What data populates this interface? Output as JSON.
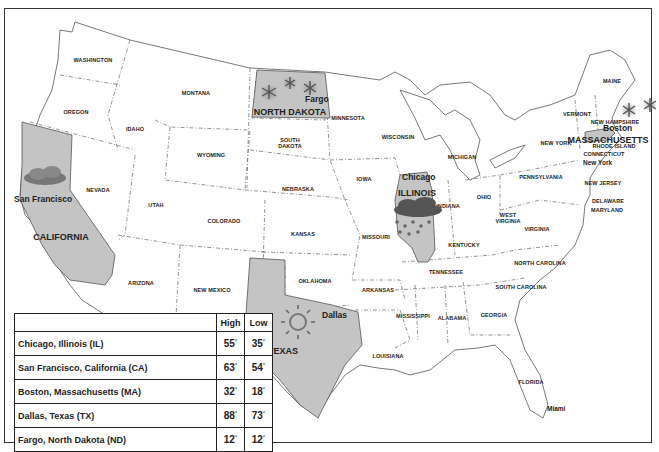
{
  "map": {
    "title": "US Weather Map",
    "highlight_color": "#c4c4c4",
    "state_labels": [
      {
        "name": "WASHINGTON",
        "x": 93,
        "y": 60
      },
      {
        "name": "OREGON",
        "x": 76,
        "y": 112
      },
      {
        "name": "IDAHO",
        "x": 135,
        "y": 129
      },
      {
        "name": "MONTANA",
        "x": 196,
        "y": 93
      },
      {
        "name": "WYOMING",
        "x": 211,
        "y": 155
      },
      {
        "name": "SOUTH\nDAKOTA",
        "x": 290,
        "y": 143
      },
      {
        "name": "MINNESOTA",
        "x": 348,
        "y": 118
      },
      {
        "name": "WISCONSIN",
        "x": 398,
        "y": 137
      },
      {
        "name": "MICHIGAN",
        "x": 462,
        "y": 157
      },
      {
        "name": "NEVADA",
        "x": 98,
        "y": 190
      },
      {
        "name": "UTAH",
        "x": 156,
        "y": 205
      },
      {
        "name": "COLORADO",
        "x": 224,
        "y": 221
      },
      {
        "name": "NEBRASKA",
        "x": 298,
        "y": 189
      },
      {
        "name": "IOWA",
        "x": 364,
        "y": 179
      },
      {
        "name": "KANSAS",
        "x": 303,
        "y": 234
      },
      {
        "name": "MISSOURI",
        "x": 376,
        "y": 237
      },
      {
        "name": "INDIANA",
        "x": 448,
        "y": 206
      },
      {
        "name": "OHIO",
        "x": 484,
        "y": 197
      },
      {
        "name": "PENNSYLVANIA",
        "x": 541,
        "y": 177
      },
      {
        "name": "NEW YORK",
        "x": 556,
        "y": 143
      },
      {
        "name": "VERMONT",
        "x": 577,
        "y": 114
      },
      {
        "name": "MAINE",
        "x": 612,
        "y": 81
      },
      {
        "name": "NEW HAMPSHIRE",
        "x": 615,
        "y": 122
      },
      {
        "name": "RHODE ISLAND",
        "x": 614,
        "y": 146
      },
      {
        "name": "CONNECTICUT",
        "x": 604,
        "y": 154
      },
      {
        "name": "NEW JERSEY",
        "x": 603,
        "y": 183
      },
      {
        "name": "DELAWARE",
        "x": 608,
        "y": 201
      },
      {
        "name": "MARYLAND",
        "x": 607,
        "y": 210
      },
      {
        "name": "WEST\nVIRGINIA",
        "x": 508,
        "y": 218
      },
      {
        "name": "VIRGINIA",
        "x": 537,
        "y": 229
      },
      {
        "name": "KENTUCKY",
        "x": 464,
        "y": 245
      },
      {
        "name": "NORTH CAROLINA",
        "x": 540,
        "y": 263
      },
      {
        "name": "TENNESSEE",
        "x": 446,
        "y": 272
      },
      {
        "name": "SOUTH CAROLINA",
        "x": 521,
        "y": 287
      },
      {
        "name": "ARIZONA",
        "x": 141,
        "y": 283
      },
      {
        "name": "NEW MEXICO",
        "x": 212,
        "y": 290
      },
      {
        "name": "OKLAHOMA",
        "x": 315,
        "y": 281
      },
      {
        "name": "ARKANSAS",
        "x": 378,
        "y": 290
      },
      {
        "name": "MISSISSIPPI",
        "x": 413,
        "y": 316
      },
      {
        "name": "ALABAMA",
        "x": 452,
        "y": 318
      },
      {
        "name": "GEORGIA",
        "x": 494,
        "y": 315
      },
      {
        "name": "LOUISIANA",
        "x": 388,
        "y": 356
      },
      {
        "name": "FLORIDA",
        "x": 531,
        "y": 382
      }
    ],
    "highlighted_states": [
      {
        "name": "NORTH DAKOTA",
        "x": 290,
        "y": 112
      },
      {
        "name": "ILLINOIS",
        "x": 417,
        "y": 193
      },
      {
        "name": "MASSACHUSETTS",
        "x": 608,
        "y": 140
      },
      {
        "name": "CALIFORNIA",
        "x": 61,
        "y": 237
      },
      {
        "name": "TEXAS",
        "x": 283,
        "y": 351
      }
    ],
    "cities": [
      {
        "name": "Fargo",
        "x": 305,
        "y": 100,
        "weather": "snow"
      },
      {
        "name": "Chicago",
        "x": 402,
        "y": 178,
        "weather": "rain"
      },
      {
        "name": "Boston",
        "x": 603,
        "y": 129,
        "weather": "snow"
      },
      {
        "name": "New York",
        "x": 583,
        "y": 165,
        "weather": ""
      },
      {
        "name": "San Francisco",
        "x": 14,
        "y": 200,
        "weather": "cloudy"
      },
      {
        "name": "Dallas",
        "x": 322,
        "y": 316,
        "weather": "sunny"
      },
      {
        "name": "Miami",
        "x": 547,
        "y": 411,
        "weather": ""
      }
    ],
    "weather_icons": [
      {
        "type": "snowflake-icon",
        "x": 269,
        "y": 91
      },
      {
        "type": "snowflake-icon",
        "x": 290,
        "y": 83
      },
      {
        "type": "snowflake-icon",
        "x": 311,
        "y": 88
      },
      {
        "type": "snowflake-icon",
        "x": 628,
        "y": 110
      },
      {
        "type": "snowflake-icon",
        "x": 648,
        "y": 104
      },
      {
        "type": "rain-cloud-icon",
        "x": 418,
        "y": 210
      },
      {
        "type": "cloud-icon",
        "x": 45,
        "y": 180
      },
      {
        "type": "sun-icon",
        "x": 298,
        "y": 322
      }
    ]
  },
  "table": {
    "headers": {
      "city": "",
      "high": "High",
      "low": "Low"
    },
    "degree_symbol": "°",
    "rows": [
      {
        "city": "Chicago, Illinois (IL)",
        "high": "55",
        "low": "35"
      },
      {
        "city": "San Francisco, California (CA)",
        "high": "63",
        "low": "54"
      },
      {
        "city": "Boston, Massachusetts (MA)",
        "high": "32",
        "low": "18"
      },
      {
        "city": "Dallas, Texas (TX)",
        "high": "88",
        "low": "73"
      },
      {
        "city": "Fargo, North Dakota (ND)",
        "high": "12",
        "low": "12"
      }
    ]
  }
}
